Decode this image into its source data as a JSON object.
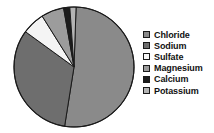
{
  "chart_data": {
    "type": "pie",
    "title": "",
    "legend_position": "right",
    "categories": [
      "Chloride",
      "Sodium",
      "Sulfate",
      "Magnesium",
      "Calcium",
      "Potassium"
    ],
    "values": [
      52.0,
      32.5,
      6.2,
      6.0,
      1.6,
      1.7
    ],
    "unit": "percent",
    "colors": [
      "#8a8a8a",
      "#6e6e6e",
      "#f4f4f4",
      "#9c9c9c",
      "#1c1c1c",
      "#b4b4b4"
    ],
    "slices": [
      {
        "label": "Chloride",
        "value": 52.0,
        "color": "#8a8a8a",
        "start_angle": 2,
        "end_angle": 189
      },
      {
        "label": "Sodium",
        "value": 32.5,
        "color": "#6e6e6e",
        "start_angle": 189,
        "end_angle": 306
      },
      {
        "label": "Sulfate",
        "value": 6.2,
        "color": "#f4f4f4",
        "start_angle": 306,
        "end_angle": 328
      },
      {
        "label": "Magnesium",
        "value": 6.0,
        "color": "#9c9c9c",
        "start_angle": 328,
        "end_angle": 350
      },
      {
        "label": "Calcium",
        "value": 1.6,
        "color": "#1c1c1c",
        "start_angle": 350,
        "end_angle": 356
      },
      {
        "label": "Potassium",
        "value": 1.7,
        "color": "#b4b4b4",
        "start_angle": 356,
        "end_angle": 362
      }
    ],
    "xlabel": "",
    "ylabel": ""
  },
  "legend": {
    "items": [
      {
        "label": "Chloride",
        "color": "#8a8a8a"
      },
      {
        "label": "Sodium",
        "color": "#6e6e6e"
      },
      {
        "label": "Sulfate",
        "color": "#f8f8f8"
      },
      {
        "label": "Magnesium",
        "color": "#9c9c9c"
      },
      {
        "label": "Calcium",
        "color": "#1c1c1c"
      },
      {
        "label": "Potassium",
        "color": "#b4b4b4"
      }
    ]
  }
}
